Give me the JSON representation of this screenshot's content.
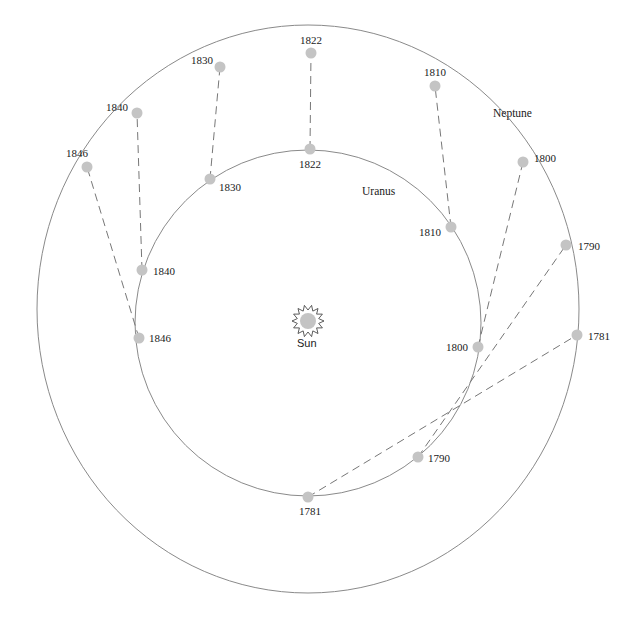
{
  "diagram": {
    "title": "",
    "sun": {
      "label": "Sun",
      "x": 308,
      "y": 323
    },
    "orbits": {
      "uranus": {
        "label": "Uranus",
        "cx": 308,
        "cy": 323,
        "rx": 173,
        "ry": 173,
        "label_x": 362,
        "label_y": 195
      },
      "neptune": {
        "label": "Neptune",
        "cx": 308,
        "cy": 309,
        "rx": 271,
        "ry": 284,
        "label_x": 493,
        "label_y": 117
      }
    },
    "positions": [
      {
        "year": "1781",
        "uranus": {
          "x": 308,
          "y": 497,
          "lx": 299,
          "ly": 515
        },
        "neptune": {
          "x": 577,
          "y": 335,
          "lx": 588,
          "ly": 340
        }
      },
      {
        "year": "1790",
        "uranus": {
          "x": 418,
          "y": 457,
          "lx": 428,
          "ly": 462
        },
        "neptune": {
          "x": 566,
          "y": 245,
          "lx": 578,
          "ly": 250
        }
      },
      {
        "year": "1800",
        "uranus": {
          "x": 478,
          "y": 347,
          "lx": 446,
          "ly": 351
        },
        "neptune": {
          "x": 523,
          "y": 162,
          "lx": 534,
          "ly": 162
        }
      },
      {
        "year": "1810",
        "uranus": {
          "x": 451,
          "y": 227,
          "lx": 419,
          "ly": 236
        },
        "neptune": {
          "x": 435,
          "y": 86,
          "lx": 424,
          "ly": 76
        }
      },
      {
        "year": "1822",
        "uranus": {
          "x": 310,
          "y": 149,
          "lx": 299,
          "ly": 168
        },
        "neptune": {
          "x": 311,
          "y": 53,
          "lx": 300,
          "ly": 44
        }
      },
      {
        "year": "1830",
        "uranus": {
          "x": 210,
          "y": 179,
          "lx": 219,
          "ly": 191
        },
        "neptune": {
          "x": 220,
          "y": 67,
          "lx": 191,
          "ly": 64
        }
      },
      {
        "year": "1840",
        "uranus": {
          "x": 142,
          "y": 270,
          "lx": 153,
          "ly": 275
        },
        "neptune": {
          "x": 137,
          "y": 113,
          "lx": 106,
          "ly": 111
        }
      },
      {
        "year": "1846",
        "uranus": {
          "x": 139,
          "y": 338,
          "lx": 149,
          "ly": 342
        },
        "neptune": {
          "x": 87,
          "y": 167,
          "lx": 66,
          "ly": 157
        }
      }
    ]
  }
}
